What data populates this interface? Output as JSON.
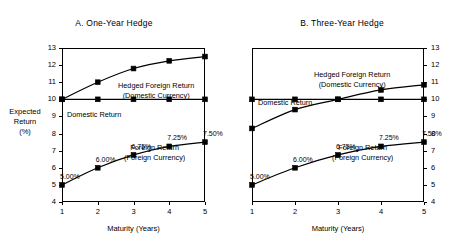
{
  "figure": {
    "axis_label_y": [
      "Expected",
      "Return",
      "(%)"
    ],
    "axis_label_x": "Maturity (Years)"
  },
  "chart_data": [
    {
      "type": "line",
      "panel_id": "A",
      "title": "A. One-Year Hedge",
      "xlabel": "Maturity (Years)",
      "ylabel": "Expected Return (%)",
      "x": [
        1,
        2,
        3,
        4,
        5
      ],
      "xticks": [
        "1",
        "2",
        "3",
        "4",
        "5"
      ],
      "xlim": [
        1,
        5
      ],
      "ylim": [
        4,
        13
      ],
      "yticks": [
        "4",
        "5",
        "6",
        "7",
        "8",
        "9",
        "10",
        "11",
        "12",
        "13"
      ],
      "ytick_side": "left",
      "grid": false,
      "legend": "inline-annotations",
      "series": [
        {
          "name": "Hedged Foreign Return (Domestic Currency)",
          "label_lines": [
            "Hedged Foreign Return",
            "(Domestic Currency)"
          ],
          "values": [
            10.0,
            11.0,
            11.8,
            12.25,
            12.5
          ],
          "marker": "square"
        },
        {
          "name": "Domestic Return",
          "label_lines": [
            "Domestic Return"
          ],
          "values": [
            10.0,
            10.0,
            10.0,
            10.0,
            10.0
          ],
          "marker": "square"
        },
        {
          "name": "Foreign Return (Foreign Currency)",
          "label_lines": [
            "Foreign Return",
            "(Foreign Currency)"
          ],
          "values": [
            5.0,
            6.0,
            6.75,
            7.25,
            7.5
          ],
          "marker": "square",
          "point_labels": [
            "5.00%",
            "6.00%",
            "6.75%",
            "7.25%",
            "7.50%"
          ]
        }
      ]
    },
    {
      "type": "line",
      "panel_id": "B",
      "title": "B. Three-Year Hedge",
      "xlabel": "Maturity (Years)",
      "ylabel": "Expected Return (%)",
      "x": [
        1,
        2,
        3,
        4,
        5
      ],
      "xticks": [
        "1",
        "2",
        "3",
        "4",
        "5"
      ],
      "xlim": [
        1,
        5
      ],
      "ylim": [
        4,
        13
      ],
      "yticks": [
        "4",
        "5",
        "6",
        "7",
        "8",
        "9",
        "10",
        "11",
        "12",
        "13"
      ],
      "ytick_side": "right",
      "grid": false,
      "legend": "inline-annotations",
      "series": [
        {
          "name": "Hedged Foreign Return (Domestic Currency)",
          "label_lines": [
            "Hedged Foreign Return",
            "(Domestic Currency)"
          ],
          "values": [
            8.3,
            9.4,
            10.0,
            10.55,
            10.85
          ],
          "marker": "square"
        },
        {
          "name": "Domestic Return",
          "label_lines": [
            "Domestic Return"
          ],
          "values": [
            10.0,
            10.0,
            10.0,
            10.0,
            10.0
          ],
          "marker": "square"
        },
        {
          "name": "Foreign Return (Foreign Currency)",
          "label_lines": [
            "Foreign Return",
            "(Foreign Currency)"
          ],
          "values": [
            5.0,
            6.0,
            6.75,
            7.25,
            7.5
          ],
          "marker": "square",
          "point_labels": [
            "5.00%",
            "6.00%",
            "6.75%",
            "7.25%",
            "7.50%"
          ]
        }
      ]
    }
  ]
}
